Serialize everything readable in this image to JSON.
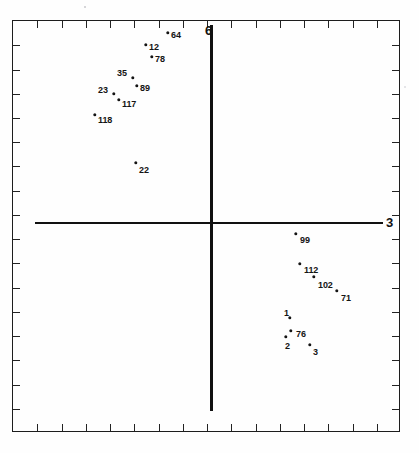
{
  "figure": {
    "scan_header_text": "",
    "background_color": "#ffffff",
    "ink_color": "#141414"
  },
  "axes": {
    "vertical_label": "6",
    "horizontal_label": "3",
    "frame": {
      "left": 12,
      "top": 20,
      "width": 388,
      "height": 412
    },
    "tick_count_horizontal": 16,
    "tick_count_vertical": 17
  },
  "chart_data": {
    "type": "scatter",
    "title": "",
    "xlabel": "3",
    "ylabel": "6",
    "grid": false,
    "legend": "none",
    "axis_style": "crosshair-through-origin",
    "xlim": [
      -5.5,
      5.5
    ],
    "ylim": [
      -5.5,
      5.5
    ],
    "note": "Point positions given in pixel coordinates of the 419x453 scan; origin of the crosshair axes is at pixel (211, 223).",
    "points": [
      {
        "label": "64",
        "px": 168,
        "py": 33,
        "lx": 171,
        "ly": 31,
        "x": -0.62,
        "y": 2.73
      },
      {
        "label": "12",
        "px": 146,
        "py": 45,
        "lx": 149,
        "ly": 43,
        "x": -0.94,
        "y": 2.56
      },
      {
        "label": "78",
        "px": 152,
        "py": 57,
        "lx": 155,
        "ly": 55,
        "x": -0.85,
        "y": 2.39
      },
      {
        "label": "35",
        "px": 133,
        "py": 78,
        "lx": 117,
        "ly": 69,
        "x": -1.12,
        "y": 2.09
      },
      {
        "label": "89",
        "px": 137,
        "py": 86,
        "lx": 140,
        "ly": 84,
        "x": -1.06,
        "y": 1.97
      },
      {
        "label": "23",
        "px": 114,
        "py": 94,
        "lx": 98,
        "ly": 86,
        "x": -1.39,
        "y": 1.86
      },
      {
        "label": "117",
        "px": 119,
        "py": 100,
        "lx": 122,
        "ly": 100,
        "x": -1.32,
        "y": 1.77
      },
      {
        "label": "118",
        "px": 95,
        "py": 115,
        "lx": 98,
        "ly": 116,
        "x": -1.67,
        "y": 1.55
      },
      {
        "label": "22",
        "px": 136,
        "py": 163,
        "lx": 139,
        "ly": 166,
        "x": -1.08,
        "y": 0.86
      },
      {
        "label": "99",
        "px": 296,
        "py": 234,
        "lx": 300,
        "ly": 236,
        "x": 1.21,
        "y": -0.16
      },
      {
        "label": "112",
        "px": 300,
        "py": 264,
        "lx": 304,
        "ly": 266,
        "x": 1.27,
        "y": -0.59
      },
      {
        "label": "102",
        "px": 314,
        "py": 277,
        "lx": 318,
        "ly": 281,
        "x": 1.47,
        "y": -0.77
      },
      {
        "label": "71",
        "px": 337,
        "py": 291,
        "lx": 341,
        "ly": 294,
        "x": 1.8,
        "y": -0.97
      },
      {
        "label": "1",
        "px": 290,
        "py": 318,
        "lx": 284,
        "ly": 309,
        "x": 1.13,
        "y": -1.36
      },
      {
        "label": "76",
        "px": 291,
        "py": 331,
        "lx": 296,
        "ly": 330,
        "x": 1.14,
        "y": -1.54
      },
      {
        "label": "2",
        "px": 286,
        "py": 337,
        "lx": 285,
        "ly": 342,
        "x": 1.07,
        "y": -1.63
      },
      {
        "label": "3",
        "px": 310,
        "py": 345,
        "lx": 313,
        "ly": 348,
        "x": 1.41,
        "y": -1.74
      }
    ]
  }
}
